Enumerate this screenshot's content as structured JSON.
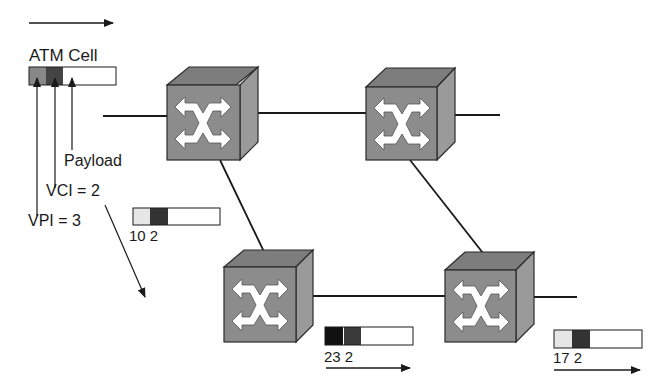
{
  "title": "ATM Cell",
  "labels": {
    "payload": "Payload",
    "vci": "VCI = 2",
    "vpi": "VPI = 3"
  },
  "cells": [
    {
      "id": "cell-1",
      "vpi": "10",
      "vci": "2",
      "label": "10 2",
      "vpi_color": "#e6e6e6",
      "vci_color": "#3a3a3a"
    },
    {
      "id": "cell-2",
      "vpi": "23",
      "vci": "2",
      "label": "23 2",
      "vpi_color": "#111111",
      "vci_color": "#3a3a3a"
    },
    {
      "id": "cell-3",
      "vpi": "17",
      "vci": "2",
      "label": "17 2",
      "vpi_color": "#e6e6e6",
      "vci_color": "#333333"
    }
  ],
  "atm_cell": {
    "vpi_color": "#888888",
    "vci_color": "#444444",
    "payload_color": "#ffffff"
  },
  "switches": [
    {
      "id": "switch-top-left"
    },
    {
      "id": "switch-top-right"
    },
    {
      "id": "switch-bottom-left"
    },
    {
      "id": "switch-bottom-right"
    }
  ],
  "colors": {
    "cube_front": "#8c8c8c",
    "cube_top": "#7d7d7d",
    "cube_side": "#9a9a9a",
    "line": "#1a1a1a"
  }
}
